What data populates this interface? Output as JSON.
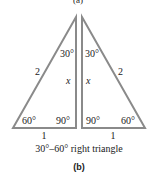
{
  "figure": {
    "top_label": "(a)",
    "left_triangle": {
      "top_angle": "30°",
      "hypotenuse": "2",
      "vertical_side": "x",
      "bottom_left_angle": "60°",
      "bottom_right_angle": "90°",
      "base": "1"
    },
    "right_triangle": {
      "top_angle": "30°",
      "hypotenuse": "2",
      "vertical_side": "x",
      "bottom_left_angle": "90°",
      "bottom_right_angle": "60°",
      "base": "1"
    },
    "caption": "30°–60° right triangle",
    "sub_label": "(b)",
    "stroke_color": "#8a8a8a"
  }
}
